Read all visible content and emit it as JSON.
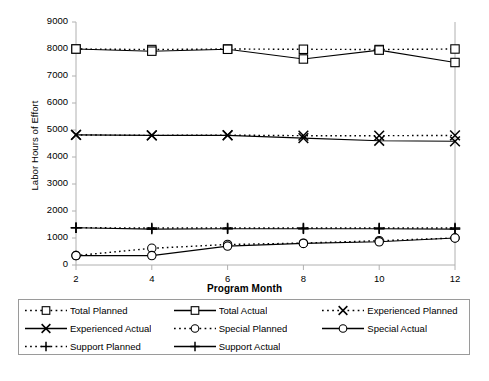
{
  "chart_data": {
    "type": "line",
    "title": "",
    "xlabel": "Program Month",
    "ylabel": "Labor Hours of Effort",
    "x": [
      2,
      4,
      6,
      8,
      10,
      12
    ],
    "xlim": [
      2,
      12
    ],
    "ylim": [
      0,
      9000
    ],
    "ytick_labels": [
      "0",
      "1000",
      "2000",
      "3000",
      "4000",
      "5000",
      "6000",
      "7000",
      "8000",
      "9000"
    ],
    "ytick_values": [
      0,
      1000,
      2000,
      3000,
      4000,
      5000,
      6000,
      7000,
      8000,
      9000
    ],
    "xtick_labels": [
      "2",
      "4",
      "6",
      "8",
      "10",
      "12"
    ],
    "grid": false,
    "legend_position": "below",
    "series": [
      {
        "name": "Total Planned",
        "style": "dotted",
        "marker": "square",
        "values": [
          8000,
          7980,
          8000,
          7990,
          7980,
          8000
        ]
      },
      {
        "name": "Total Actual",
        "style": "solid",
        "marker": "square",
        "values": [
          8000,
          7920,
          7990,
          7630,
          7960,
          7500
        ]
      },
      {
        "name": "Experienced Planned",
        "style": "dotted",
        "marker": "cross",
        "values": [
          4820,
          4800,
          4810,
          4790,
          4790,
          4800
        ]
      },
      {
        "name": "Experienced Actual",
        "style": "solid",
        "marker": "cross",
        "values": [
          4820,
          4800,
          4800,
          4700,
          4600,
          4580
        ]
      },
      {
        "name": "Special Planned",
        "style": "dotted",
        "marker": "circle",
        "values": [
          350,
          620,
          760,
          810,
          900,
          1000
        ]
      },
      {
        "name": "Special Actual",
        "style": "solid",
        "marker": "circle",
        "values": [
          350,
          350,
          700,
          800,
          860,
          1000
        ]
      },
      {
        "name": "Support Planned",
        "style": "dotted",
        "marker": "plus",
        "values": [
          1380,
          1370,
          1370,
          1370,
          1370,
          1370
        ]
      },
      {
        "name": "Support Actual",
        "style": "solid",
        "marker": "plus",
        "values": [
          1380,
          1330,
          1340,
          1340,
          1340,
          1330
        ]
      }
    ]
  },
  "legend": {
    "items": [
      {
        "label": "Total Planned",
        "style": "dotted",
        "marker": "square"
      },
      {
        "label": "Total Actual",
        "style": "solid",
        "marker": "square"
      },
      {
        "label": "Experienced Planned",
        "style": "dotted",
        "marker": "cross"
      },
      {
        "label": "Experienced Actual",
        "style": "solid",
        "marker": "cross"
      },
      {
        "label": "Special Planned",
        "style": "dotted",
        "marker": "circle"
      },
      {
        "label": "Special Actual",
        "style": "solid",
        "marker": "circle"
      },
      {
        "label": "Support Planned",
        "style": "dotted",
        "marker": "plus"
      },
      {
        "label": "Support Actual",
        "style": "solid",
        "marker": "plus"
      }
    ]
  },
  "caption": "",
  "colors": {
    "line": "#000000",
    "axis": "#b0b0b0",
    "text": "#000000",
    "legend_border": "#9a9a9a",
    "background": "#ffffff"
  }
}
